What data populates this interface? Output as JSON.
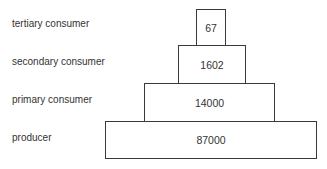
{
  "diagram": {
    "type": "ecological-pyramid",
    "levels": [
      {
        "label": "tertiary consumer",
        "value": "67"
      },
      {
        "label": "secondary consumer",
        "value": "1602"
      },
      {
        "label": "primary consumer",
        "value": "14000"
      },
      {
        "label": "producer",
        "value": "87000"
      }
    ]
  }
}
